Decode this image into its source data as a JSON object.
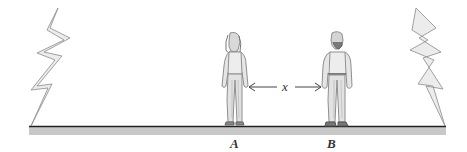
{
  "diagram": {
    "labels": {
      "person_a": "A",
      "person_b": "B",
      "separation": "x"
    },
    "colors": {
      "background": "#ffffff",
      "ground_line": "#222222",
      "ground_band": "#c8c8c8",
      "bolt_fill": "#ececec",
      "bolt_stroke": "#8a8a8a",
      "figure": "#9a9a9a",
      "arrow": "#444444"
    }
  }
}
